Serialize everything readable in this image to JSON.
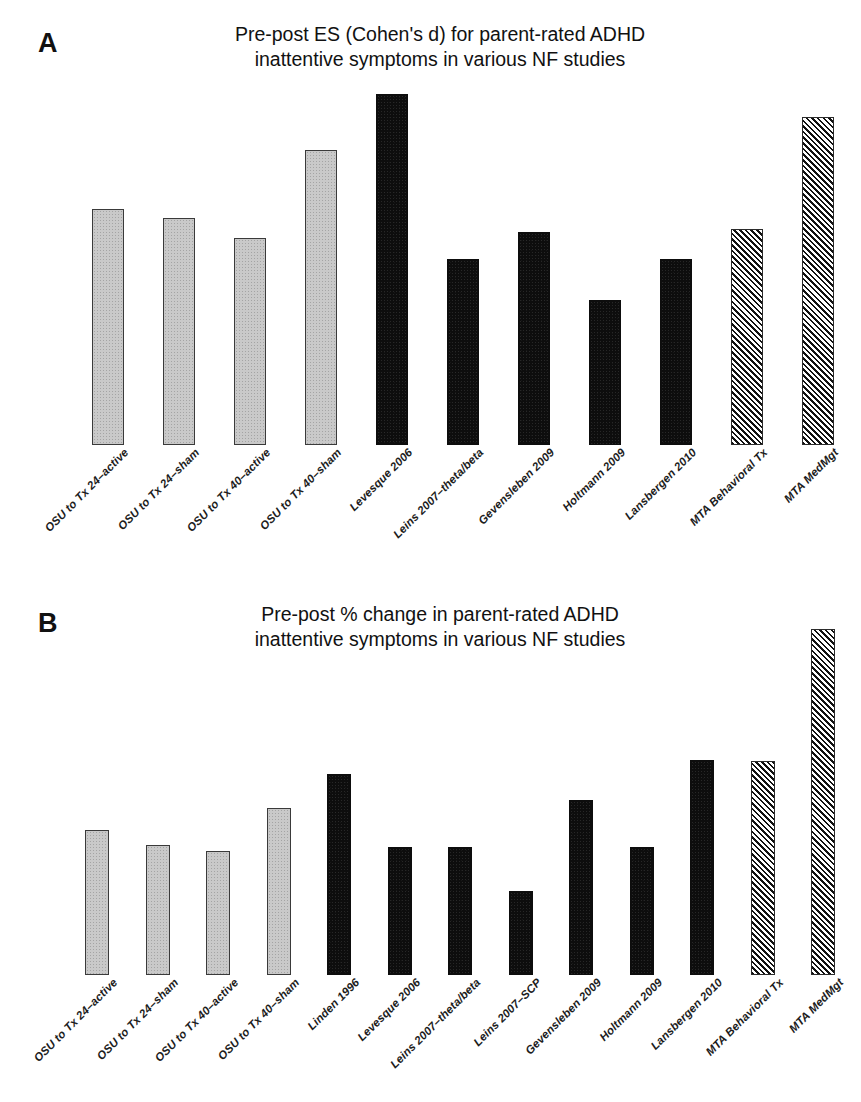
{
  "figure": {
    "background": "#ffffff",
    "width": 861,
    "height": 1102
  },
  "panels": [
    {
      "letter": "A",
      "title": "Pre-post ES (Cohen's d) for parent-rated ADHD\ninattentive symptoms in various NF studies"
    },
    {
      "letter": "B",
      "title": "Pre-post % change in parent-rated ADHD\ninattentive symptoms in various NF studies"
    }
  ],
  "legend_groups": {
    "osu_grey": "#c9c9c9",
    "nf_black": "#0d0d0d",
    "mta_hatched": "#2b2b2b"
  },
  "chart_data": [
    {
      "panel": "A",
      "type": "bar",
      "title": "Pre-post ES (Cohen's d) for parent-rated ADHD inattentive symptoms in various NF studies",
      "xlabel": "",
      "ylabel": "Effect size (Cohen's d)",
      "ylim": [
        0,
        1.5
      ],
      "grid": false,
      "legend": "none",
      "axis_visible": false,
      "categories": [
        "OSU to Tx 24–active",
        "OSU to Tx 24–sham",
        "OSU to Tx 40–active",
        "OSU to Tx 40–sham",
        "Levesque 2006",
        "Leins 2007–theta/beta",
        "Gevensleben 2009",
        "Holtmann 2009",
        "Lansbergen 2010",
        "MTA Behavioral Tx",
        "MTA MedMgt"
      ],
      "values": [
        0.8,
        0.77,
        0.7,
        1.0,
        1.19,
        0.63,
        0.72,
        0.49,
        0.63,
        0.73,
        1.11
      ],
      "styles": [
        "grey",
        "grey",
        "grey",
        "grey",
        "black",
        "black",
        "black",
        "black",
        "black",
        "hatch",
        "hatch"
      ]
    },
    {
      "panel": "B",
      "type": "bar",
      "title": "Pre-post % change in parent-rated ADHD inattentive symptoms in various NF studies",
      "xlabel": "",
      "ylabel": "% change",
      "ylim": [
        0,
        60
      ],
      "grid": false,
      "legend": "none",
      "axis_visible": false,
      "categories": [
        "OSU to Tx 24–active",
        "OSU to Tx 24–sham",
        "OSU to Tx 40–active",
        "OSU to Tx 40–sham",
        "Linden 1996",
        "Levesque 2006",
        "Leins 2007–theta/beta",
        "Leins 2007–SCP",
        "Gevensleben 2009",
        "Holtmann 2009",
        "Lansbergen 2010",
        "MTA Behavioral Tx",
        "MTA MedMgt"
      ],
      "values": [
        21.6,
        19.4,
        18.5,
        24.9,
        30.0,
        19.0,
        19.0,
        12.5,
        26.0,
        19.0,
        32.0,
        31.8,
        51.5
      ],
      "styles": [
        "grey",
        "grey",
        "grey",
        "grey",
        "black",
        "black",
        "black",
        "black",
        "black",
        "black",
        "black",
        "hatch",
        "hatch"
      ]
    }
  ]
}
